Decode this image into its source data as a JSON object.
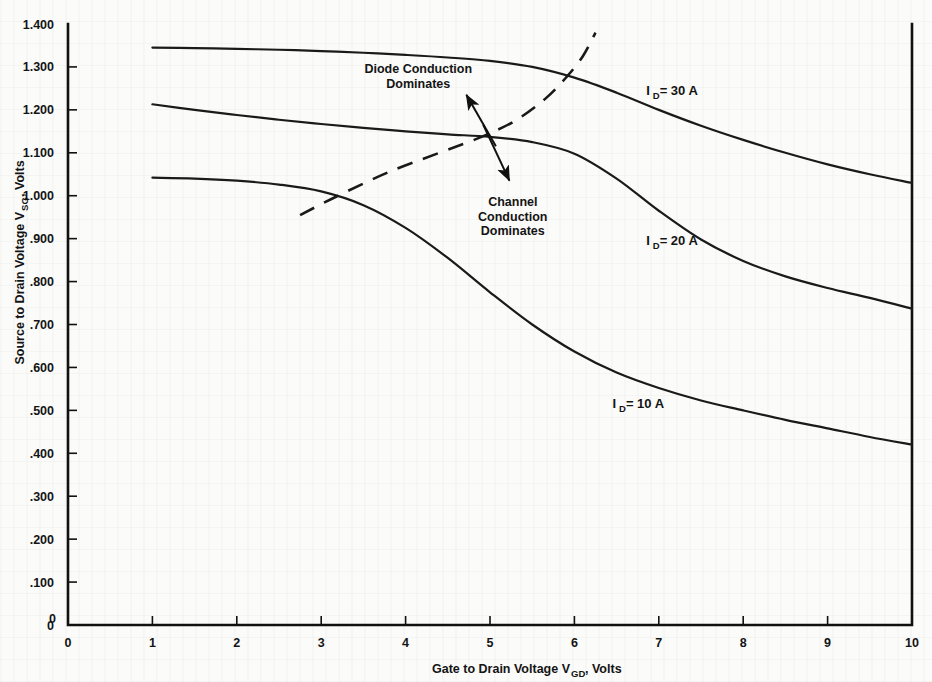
{
  "chart_data": {
    "type": "line",
    "title": "",
    "xlabel": "Gate to Drain Voltage V",
    "xlabel_sub": "GD",
    "xlabel_tail": ", Volts",
    "ylabel": "Source to Drain Voltage V",
    "ylabel_sub": "SG",
    "ylabel_tail": ", Volts",
    "xlim": [
      0,
      10
    ],
    "ylim": [
      0,
      1.4
    ],
    "grid": false,
    "legend_position": "inline-right",
    "xticks": [
      "0",
      "1",
      "2",
      "3",
      "4",
      "5",
      "6",
      "7",
      "8",
      "9",
      "10"
    ],
    "xtick_values": [
      0,
      1,
      2,
      3,
      4,
      5,
      6,
      7,
      8,
      9,
      10
    ],
    "yticks": [
      "0",
      ".100",
      ".200",
      ".300",
      ".400",
      ".500",
      ".600",
      ".700",
      ".800",
      ".900",
      "1.000",
      "1.100",
      "1.200",
      "1.300",
      "1.400"
    ],
    "ytick_values": [
      0,
      0.1,
      0.2,
      0.3,
      0.4,
      0.5,
      0.6,
      0.7,
      0.8,
      0.9,
      1.0,
      1.1,
      1.2,
      1.3,
      1.4
    ],
    "x": [
      1,
      1.5,
      2,
      2.5,
      3,
      3.5,
      4,
      4.5,
      5,
      5.5,
      6,
      6.5,
      7,
      7.5,
      8,
      8.5,
      9,
      9.5,
      10
    ],
    "series": [
      {
        "name": "ID = 30 A",
        "label_main": "I",
        "label_sub": "D",
        "label_tail": " = 30 A",
        "current_amps": 30,
        "label_x": 6.85,
        "label_y": 1.235,
        "values": [
          1.345,
          1.344,
          1.342,
          1.34,
          1.337,
          1.333,
          1.328,
          1.322,
          1.314,
          1.3,
          1.275,
          1.24,
          1.2,
          1.163,
          1.13,
          1.1,
          1.073,
          1.05,
          1.03
        ]
      },
      {
        "name": "ID = 20 A",
        "label_main": "I",
        "label_sub": "D",
        "label_tail": " = 20 A",
        "current_amps": 20,
        "label_x": 6.85,
        "label_y": 0.885,
        "values": [
          1.213,
          1.2,
          1.188,
          1.177,
          1.167,
          1.158,
          1.15,
          1.143,
          1.137,
          1.125,
          1.098,
          1.04,
          0.965,
          0.898,
          0.848,
          0.812,
          0.785,
          0.762,
          0.737
        ]
      },
      {
        "name": "ID = 10 A",
        "label_main": "I",
        "label_sub": "D",
        "label_tail": " = 10 A",
        "current_amps": 10,
        "label_x": 6.45,
        "label_y": 0.505,
        "values": [
          1.042,
          1.04,
          1.035,
          1.026,
          1.01,
          0.978,
          0.925,
          0.855,
          0.775,
          0.7,
          0.637,
          0.588,
          0.552,
          0.523,
          0.5,
          0.478,
          0.458,
          0.438,
          0.42
        ]
      }
    ],
    "boundary": {
      "name": "conduction-boundary",
      "style": "dashed",
      "x": [
        2.75,
        3.2,
        3.8,
        4.4,
        4.9,
        5.3,
        5.65,
        5.9,
        6.1,
        6.25
      ],
      "y": [
        0.955,
        1.0,
        1.055,
        1.1,
        1.137,
        1.175,
        1.225,
        1.275,
        1.325,
        1.38
      ]
    },
    "annotations": [
      {
        "name": "diode-conduction-annotation",
        "line1": "Diode Conduction",
        "line2": "Dominates",
        "text_x": 4.15,
        "text_y": 1.285,
        "arrow_from_x": 5.07,
        "arrow_from_y": 1.115,
        "arrow_to_x": 4.72,
        "arrow_to_y": 1.235
      },
      {
        "name": "channel-conduction-annotation",
        "line1": "Channel",
        "line2": "Conduction",
        "line3": "Dominates",
        "text_x": 5.27,
        "text_y": 0.975,
        "arrow_from_x": 4.92,
        "arrow_from_y": 1.165,
        "arrow_to_x": 5.23,
        "arrow_to_y": 1.035
      }
    ],
    "colors": {
      "curve": "#1a1a1a",
      "axis": "#111111",
      "background": "#fbfbfa"
    }
  }
}
